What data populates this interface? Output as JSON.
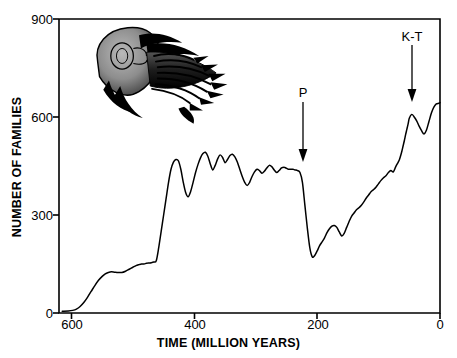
{
  "chart_data": {
    "type": "line",
    "title": "",
    "subtitle": "",
    "xlabel": "TIME  (MILLION YEARS)",
    "ylabel": "NUMBER OF FAMILIES",
    "xlim": [
      620,
      0
    ],
    "ylim": [
      0,
      900
    ],
    "x_axis_reversed": true,
    "grid": false,
    "legend": "none",
    "xticks": [
      {
        "value": 600,
        "label": "600"
      },
      {
        "value": 400,
        "label": "400"
      },
      {
        "value": 200,
        "label": "200"
      },
      {
        "value": 0,
        "label": "0"
      }
    ],
    "yticks": [
      {
        "value": 0,
        "label": "0"
      },
      {
        "value": 300,
        "label": "300"
      },
      {
        "value": 600,
        "label": "600"
      },
      {
        "value": 900,
        "label": "900"
      }
    ],
    "series": [
      {
        "name": "Marine family diversity",
        "x": [
          615,
          605,
          598,
          592,
          586,
          580,
          574,
          568,
          562,
          556,
          550,
          545,
          540,
          535,
          530,
          524,
          518,
          512,
          506,
          500,
          495,
          490,
          486,
          482,
          478,
          474,
          470,
          466,
          462,
          458,
          454,
          450,
          446,
          442,
          438,
          434,
          430,
          426,
          422,
          418,
          414,
          410,
          406,
          402,
          398,
          394,
          390,
          386,
          382,
          378,
          374,
          370,
          366,
          362,
          358,
          354,
          350,
          346,
          342,
          338,
          334,
          330,
          326,
          322,
          318,
          314,
          310,
          306,
          302,
          298,
          294,
          290,
          286,
          282,
          278,
          274,
          270,
          266,
          262,
          258,
          254,
          251,
          249,
          247,
          245,
          243,
          241,
          239,
          236,
          232,
          228,
          224,
          220,
          216,
          212,
          208,
          204,
          200,
          196,
          192,
          188,
          184,
          180,
          176,
          172,
          168,
          164,
          160,
          156,
          152,
          148,
          144,
          140,
          136,
          132,
          128,
          124,
          120,
          116,
          112,
          108,
          104,
          100,
          96,
          92,
          88,
          84,
          80,
          76,
          72,
          68,
          66,
          64,
          62,
          60,
          58,
          56,
          54,
          52,
          50,
          46,
          42,
          38,
          34,
          30,
          26,
          22,
          18,
          14,
          10,
          6,
          2,
          0
        ],
        "y": [
          5,
          6,
          8,
          12,
          20,
          32,
          48,
          66,
          84,
          100,
          112,
          120,
          124,
          126,
          125,
          124,
          124,
          128,
          134,
          140,
          145,
          148,
          150,
          150,
          152,
          153,
          154,
          156,
          160,
          200,
          250,
          300,
          350,
          400,
          440,
          462,
          470,
          466,
          440,
          400,
          368,
          356,
          372,
          400,
          430,
          455,
          475,
          488,
          492,
          480,
          456,
          438,
          452,
          472,
          484,
          476,
          460,
          470,
          482,
          486,
          478,
          462,
          440,
          418,
          400,
          390,
          400,
          418,
          432,
          440,
          436,
          428,
          434,
          444,
          452,
          448,
          438,
          430,
          436,
          444,
          446,
          444,
          442,
          440,
          440,
          440,
          440,
          440,
          438,
          436,
          430,
          400,
          330,
          260,
          200,
          172,
          176,
          190,
          206,
          218,
          230,
          246,
          258,
          266,
          268,
          262,
          248,
          236,
          244,
          262,
          280,
          296,
          306,
          316,
          322,
          330,
          340,
          352,
          362,
          372,
          378,
          386,
          396,
          406,
          414,
          420,
          430,
          436,
          432,
          448,
          462,
          470,
          482,
          496,
          512,
          528,
          546,
          562,
          578,
          596,
          608,
          600,
          588,
          572,
          558,
          548,
          560,
          586,
          612,
          630,
          640,
          642,
          644
        ]
      }
    ],
    "annotations": [
      {
        "name": "permian-extinction",
        "label": "P",
        "x": 250,
        "description": "Permian mass extinction arrow",
        "arrow_tip_y": 470,
        "arrow_tail_y": 660
      },
      {
        "name": "cretaceous-tertiary-extinction",
        "label": "K-T",
        "x": 62,
        "description": "Cretaceous-Tertiary mass extinction arrow",
        "arrow_tip_y": 680,
        "arrow_tail_y": 820
      }
    ],
    "illustration": {
      "name": "trilobite-fossil-illustration",
      "caption": "",
      "x_range": [
        545,
        420
      ],
      "y_range": [
        700,
        880
      ]
    },
    "colors": {
      "line": "#000000",
      "axis": "#000000",
      "background": "#ffffff"
    }
  }
}
